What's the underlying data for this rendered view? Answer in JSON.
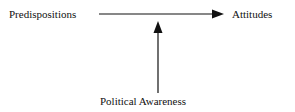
{
  "diagram": {
    "nodes": [
      {
        "id": "predispositions",
        "label": "Predispositions"
      },
      {
        "id": "attitudes",
        "label": "Attitudes"
      },
      {
        "id": "political_awareness",
        "label": "Political Awareness"
      }
    ],
    "edges": [
      {
        "from": "predispositions",
        "to": "attitudes",
        "type": "arrow"
      },
      {
        "from": "political_awareness",
        "to": "predispositions->attitudes",
        "type": "arrow",
        "note": "moderating arrow pointing at the main arrow"
      }
    ],
    "colors": {
      "line": "#111111",
      "text": "#111111",
      "background": "#ffffff"
    }
  }
}
